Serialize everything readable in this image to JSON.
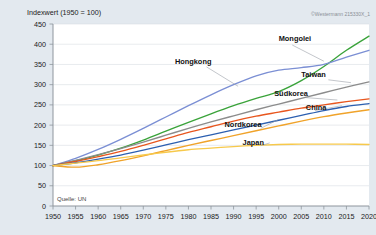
{
  "meta": {
    "axis_title": "Indexwert (1950 = 100)",
    "source": "Quelle: UN",
    "copyright": "©Westermann 215330X_1"
  },
  "chart_data": {
    "type": "line",
    "title": "Indexwert (1950 = 100)",
    "xlabel": "",
    "ylabel": "Indexwert (1950 = 100)",
    "xlim": [
      1950,
      2020
    ],
    "ylim": [
      0,
      450
    ],
    "ytick_step": 50,
    "xtick_step": 5,
    "grid": true,
    "legend": "inline-labels",
    "x": [
      1950,
      1955,
      1960,
      1965,
      1970,
      1975,
      1980,
      1985,
      1990,
      1995,
      2000,
      2005,
      2010,
      2015,
      2020
    ],
    "yticks": [
      0,
      50,
      100,
      150,
      200,
      250,
      300,
      350,
      400,
      450
    ],
    "xticks": [
      1950,
      1955,
      1960,
      1965,
      1970,
      1975,
      1980,
      1985,
      1990,
      1995,
      2000,
      2005,
      2010,
      2015,
      2020
    ],
    "series": [
      {
        "name": "Mongolei",
        "color": "#3aa33a",
        "label_x": 2000,
        "label_y": 408,
        "leader": [
          [
            2003,
            398
          ],
          [
            2010,
            358
          ]
        ],
        "values": [
          100,
          112,
          126,
          143,
          163,
          185,
          207,
          228,
          248,
          266,
          283,
          310,
          345,
          385,
          420
        ]
      },
      {
        "name": "Hongkong",
        "color": "#7b8fd4",
        "label_x": 1977,
        "label_y": 352,
        "leader": [
          [
            1984,
            344
          ],
          [
            1991,
            296
          ]
        ],
        "values": [
          100,
          118,
          140,
          165,
          192,
          220,
          248,
          275,
          300,
          322,
          336,
          342,
          350,
          368,
          385
        ]
      },
      {
        "name": "Taiwan",
        "color": "#8c8c8c",
        "label_x": 2005,
        "label_y": 318,
        "leader": [
          [
            2011,
            312
          ],
          [
            2016,
            305
          ]
        ],
        "values": [
          100,
          113,
          127,
          142,
          158,
          175,
          192,
          208,
          223,
          238,
          252,
          266,
          280,
          294,
          307
        ]
      },
      {
        "name": "Südkorea",
        "color": "#e8561e",
        "label_x": 1999,
        "label_y": 272,
        "leader": [
          [
            2006,
            268
          ],
          [
            2013,
            262
          ]
        ],
        "values": [
          100,
          110,
          122,
          135,
          150,
          166,
          182,
          196,
          210,
          222,
          232,
          242,
          250,
          258,
          265
        ]
      },
      {
        "name": "China",
        "color": "#2c5fb0",
        "label_x": 2006,
        "label_y": 238,
        "leader": [
          [
            2008,
            236
          ],
          [
            2014,
            248
          ]
        ],
        "values": [
          100,
          107,
          116,
          126,
          138,
          151,
          164,
          176,
          188,
          200,
          212,
          224,
          236,
          246,
          253
        ]
      },
      {
        "name": "Nordkorea",
        "color": "#f0a32a",
        "label_x": 1988,
        "label_y": 196,
        "leader": [
          [
            1996,
            192
          ],
          [
            2000,
            214
          ]
        ],
        "values": [
          100,
          96,
          102,
          112,
          124,
          137,
          150,
          162,
          174,
          186,
          198,
          210,
          221,
          230,
          238
        ]
      },
      {
        "name": "Japan",
        "color": "#f7c94b",
        "label_x": 1992,
        "label_y": 152,
        "leader": [
          [
            1996,
            149
          ],
          [
            1998,
            156
          ]
        ],
        "values": [
          100,
          106,
          112,
          119,
          126,
          133,
          139,
          143,
          147,
          150,
          152,
          153,
          153,
          153,
          152
        ]
      }
    ]
  }
}
